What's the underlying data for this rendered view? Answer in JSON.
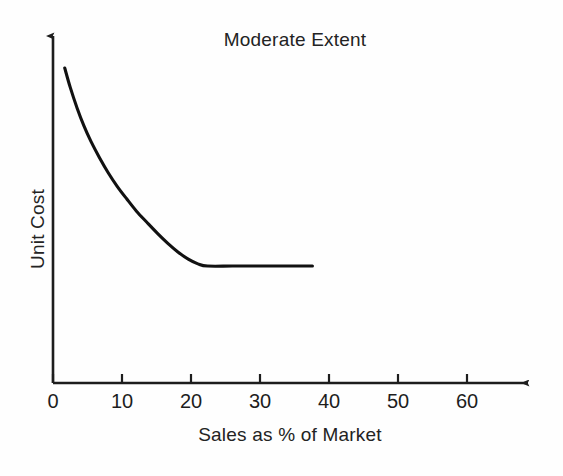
{
  "chart_data": {
    "type": "line",
    "title": "Moderate Extent",
    "xlabel": "Sales as % of Market",
    "ylabel": "Unit Cost",
    "xlim": [
      0,
      69
    ],
    "ylim": [
      0,
      1
    ],
    "grid": false,
    "legend": null,
    "xticks": [
      0,
      10,
      20,
      30,
      40,
      50,
      60
    ],
    "xtick_labels": [
      "0",
      "10",
      "20",
      "30",
      "40",
      "50",
      "60"
    ],
    "yticks": [],
    "ytick_labels": [],
    "axis_arrows": {
      "x": true,
      "y": true
    },
    "series": [
      {
        "name": "Unit Cost experience curve",
        "description": "Steeply declining unit cost that flattens to a plateau near 22% share",
        "x": [
          1.7,
          2.5,
          3.5,
          4.5,
          5.5,
          6.7,
          8.0,
          9.3,
          10.7,
          12.1,
          13.6,
          15.1,
          16.6,
          18.1,
          19.6,
          21.0,
          22.4,
          26.0,
          30.0,
          34.0,
          37.6
        ],
        "y": [
          1.0,
          0.93,
          0.855,
          0.79,
          0.735,
          0.678,
          0.622,
          0.573,
          0.527,
          0.483,
          0.443,
          0.404,
          0.368,
          0.336,
          0.31,
          0.293,
          0.285,
          0.285,
          0.285,
          0.285,
          0.285
        ],
        "plateau_value": 0.285,
        "plateau_starts_at_x": 22.4,
        "curve_ends_at_x": 37.6
      }
    ],
    "annotations": []
  },
  "figure": {
    "title": "Moderate Extent",
    "xaxis_title": "Sales as % of Market",
    "yaxis_title": "Unit Cost",
    "tick_labels": [
      "0",
      "10",
      "20",
      "30",
      "40",
      "50",
      "60"
    ],
    "colors": {
      "background": "#fefefe",
      "axis": "#1d1d1d",
      "curve": "#111111",
      "text": "#232323"
    }
  }
}
